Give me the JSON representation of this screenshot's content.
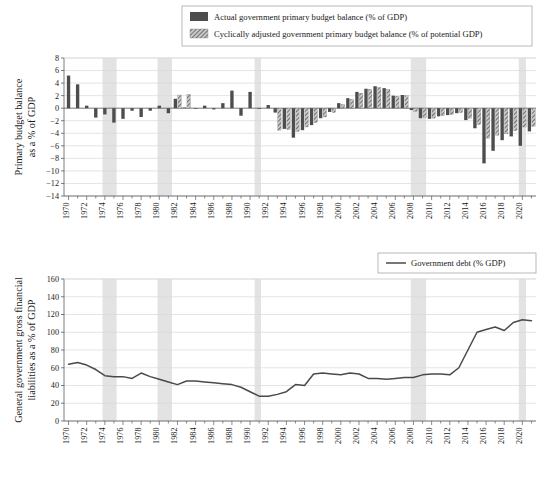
{
  "figure": {
    "panels": [
      "primary-budget-balance-panel",
      "government-debt-panel"
    ]
  },
  "panel1": {
    "legend": {
      "items": [
        {
          "key": "actual",
          "label": "Actual government primary budget balance (% of GDP)",
          "swatch": "solid-dark-gray"
        },
        {
          "key": "adjusted",
          "label": "Cyclically adjusted government primary budget balance (% of potential GDP)",
          "swatch": "hatched-gray"
        }
      ]
    },
    "ylabel_line1": "Primary budget balance",
    "ylabel_line2": "as a % of GDP"
  },
  "panel2": {
    "legend": {
      "items": [
        {
          "key": "debt",
          "label": "Government debt (% GDP)",
          "swatch": "line-dark-gray"
        }
      ]
    },
    "ylabel_line1": "General government gross financial",
    "ylabel_line2": "liabilities as a % of GDP"
  },
  "colors": {
    "bar_actual": "#4d4d4d",
    "bar_adjusted": "#8a8a8a",
    "debt_line": "#4a4a4a",
    "recession_band": "#e3e3e3",
    "gridline": "#d9d9d9",
    "axis": "#5a5a5a",
    "background": "#ffffff"
  },
  "chart_data": [
    {
      "type": "bar",
      "title": "Primary budget balance as a % of GDP",
      "xlabel": "",
      "ylabel": "Primary budget balance as a % of GDP",
      "ylim": [
        -14,
        8
      ],
      "yticks": [
        8,
        6,
        4,
        2,
        0,
        -2,
        -4,
        -6,
        -8,
        -10,
        -12,
        -14
      ],
      "ytick_labels": [
        "8",
        "6",
        "4",
        "2",
        "0",
        "−2",
        "−4",
        "−6",
        "−8",
        "−10",
        "−12",
        "−14"
      ],
      "grid": true,
      "legend_position": "top-center",
      "x": [
        1970,
        1971,
        1972,
        1973,
        1974,
        1975,
        1976,
        1977,
        1978,
        1979,
        1980,
        1981,
        1982,
        1983,
        1984,
        1985,
        1986,
        1987,
        1988,
        1989,
        1990,
        1991,
        1992,
        1993,
        1994,
        1995,
        1996,
        1997,
        1998,
        1999,
        2000,
        2001,
        2002,
        2003,
        2004,
        2005,
        2006,
        2007,
        2008,
        2009,
        2010,
        2011,
        2012,
        2013,
        2014,
        2015,
        2016,
        2017,
        2018,
        2019,
        2020,
        2021
      ],
      "xtick_labels": [
        "1970",
        "1972",
        "1974",
        "1976",
        "1978",
        "1980",
        "1982",
        "1984",
        "1986",
        "1988",
        "1990",
        "1992",
        "1994",
        "1996",
        "1998",
        "2000",
        "2002",
        "2004",
        "2006",
        "2008",
        "2010",
        "2012",
        "2014",
        "2016",
        "2018",
        "2020"
      ],
      "xtick_values": [
        1970,
        1972,
        1974,
        1976,
        1978,
        1980,
        1982,
        1984,
        1986,
        1988,
        1990,
        1992,
        1994,
        1996,
        1998,
        2000,
        2002,
        2004,
        2006,
        2008,
        2010,
        2012,
        2014,
        2016,
        2018,
        2020
      ],
      "series": [
        {
          "name": "Actual government primary budget balance (% of GDP)",
          "values": [
            5.2,
            3.8,
            0.4,
            -1.5,
            -1.0,
            -2.3,
            -1.7,
            -0.4,
            -1.4,
            -0.4,
            0.4,
            -0.8,
            1.5,
            0.1,
            -0.1,
            0.4,
            -0.2,
            0.8,
            2.8,
            -1.2,
            2.6,
            -0.1,
            0.5,
            -0.7,
            -3.3,
            -4.7,
            -3.5,
            -2.7,
            -1.6,
            -0.6,
            0.8,
            1.6,
            2.6,
            3.1,
            3.5,
            3.2,
            2.0,
            2.1,
            -0.3,
            -1.6,
            -1.7,
            -1.3,
            -1.1,
            -0.8,
            -1.9,
            -3.2,
            -8.8,
            -6.8,
            -5.1,
            -4.5,
            -6.0,
            -3.7,
            -3.5,
            -2.6,
            -2.2,
            -0.6,
            0.1,
            -0.1,
            -11.4,
            -5.7
          ]
        },
        {
          "name": "Cyclically adjusted government primary budget balance (% of potential GDP)",
          "values": [
            null,
            null,
            null,
            null,
            null,
            null,
            null,
            null,
            null,
            null,
            null,
            null,
            2.1,
            2.2,
            null,
            null,
            null,
            null,
            null,
            null,
            null,
            null,
            null,
            -3.5,
            -3.4,
            -3.7,
            -3.0,
            -2.3,
            -1.4,
            -0.7,
            0.6,
            1.4,
            2.4,
            3.0,
            3.3,
            3.0,
            1.9,
            2.0,
            -0.5,
            -1.5,
            -1.6,
            -1.2,
            -1.0,
            -0.7,
            -1.6,
            -2.6,
            -4.8,
            -4.3,
            -4.1,
            -3.6,
            -3.0,
            -2.9,
            -2.3,
            -1.9,
            -0.4,
            0.1,
            -0.1,
            -3.5,
            -5.9
          ]
        }
      ],
      "recession_bands": [
        [
          1973.75,
          1975.3
        ],
        [
          1979.8,
          1981.4
        ],
        [
          1990.5,
          1991.2
        ],
        [
          2007.7,
          2009.4
        ],
        [
          2019.6,
          2020.4
        ]
      ],
      "notes": "Paired bars per year: solid dark gray = actual, hatched = cyclically adjusted (begins ~1980)"
    },
    {
      "type": "line",
      "title": "General government gross financial liabilities as a % of GDP",
      "xlabel": "",
      "ylabel": "General government gross financial liabilities as a % of GDP",
      "ylim": [
        0,
        160
      ],
      "yticks": [
        0,
        20,
        40,
        60,
        80,
        100,
        120,
        140,
        160
      ],
      "ytick_labels": [
        "0",
        "20",
        "40",
        "60",
        "80",
        "100",
        "120",
        "140",
        "160"
      ],
      "grid": true,
      "legend_position": "top-right",
      "x": [
        1970,
        1971,
        1972,
        1973,
        1974,
        1975,
        1976,
        1977,
        1978,
        1979,
        1980,
        1981,
        1982,
        1983,
        1984,
        1985,
        1986,
        1987,
        1988,
        1989,
        1990,
        1991,
        1992,
        1993,
        1994,
        1995,
        1996,
        1997,
        1998,
        1999,
        2000,
        2001,
        2002,
        2003,
        2004,
        2005,
        2006,
        2007,
        2008,
        2009,
        2010,
        2011,
        2012,
        2013,
        2014,
        2015,
        2016,
        2017,
        2018,
        2019,
        2020,
        2021
      ],
      "xtick_labels": [
        "1970",
        "1972",
        "1974",
        "1976",
        "1978",
        "1980",
        "1982",
        "1984",
        "1986",
        "1988",
        "1990",
        "1992",
        "1994",
        "1996",
        "1998",
        "2000",
        "2002",
        "2004",
        "2006",
        "2008",
        "2010",
        "2012",
        "2014",
        "2016",
        "2018",
        "2020"
      ],
      "xtick_values": [
        1970,
        1972,
        1974,
        1976,
        1978,
        1980,
        1982,
        1984,
        1986,
        1988,
        1990,
        1992,
        1994,
        1996,
        1998,
        2000,
        2002,
        2004,
        2006,
        2008,
        2010,
        2012,
        2014,
        2016,
        2018,
        2020
      ],
      "series": [
        {
          "name": "Government debt (% GDP)",
          "values": [
            64,
            66,
            63,
            58,
            51,
            50,
            50,
            48,
            54,
            50,
            47,
            44,
            41,
            45,
            45,
            44,
            43,
            42,
            41,
            38,
            33,
            28,
            28,
            30,
            33,
            41,
            40,
            53,
            54,
            53,
            52,
            54,
            53,
            48,
            48,
            47,
            48,
            49,
            49,
            52,
            53,
            53,
            52,
            60,
            80,
            100,
            103,
            106,
            102,
            111,
            114,
            113,
            117,
            119,
            119,
            116,
            119,
            148,
            143
          ]
        }
      ],
      "recession_bands": [
        [
          1973.75,
          1975.3
        ],
        [
          1979.8,
          1981.4
        ],
        [
          1990.5,
          1991.2
        ],
        [
          2007.7,
          2009.4
        ],
        [
          2019.6,
          2020.4
        ]
      ]
    }
  ]
}
